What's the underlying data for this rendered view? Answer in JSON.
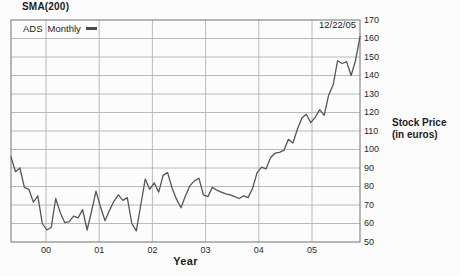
{
  "title": "SMA(200)",
  "legend": {
    "series": "ADS",
    "interval": "Monthly",
    "marker": "line-swatch"
  },
  "date_label": "12/22/05",
  "y_axis": {
    "title_line1": "Stock Price",
    "title_line2": "(in euros)"
  },
  "x_axis": {
    "title": "Year"
  },
  "colors": {
    "series_line": "#565656",
    "grid": "#b2b2b2",
    "plot_border": "#7d7d7d",
    "text": "#1c1c1c",
    "background": "#fcfcfc"
  },
  "chart_data": {
    "type": "line",
    "title": "SMA(200)",
    "series_name": "ADS Monthly",
    "annotation": "12/22/05",
    "xlabel": "Year",
    "ylabel": "Stock Price (in euros)",
    "legend_position": "top-left-inside",
    "grid": true,
    "ylim": [
      50,
      170
    ],
    "ytick_step": 10,
    "x_tick_labels": [
      "00",
      "01",
      "02",
      "03",
      "04",
      "05"
    ],
    "x_tick_years": [
      2000,
      2001,
      2002,
      2003,
      2004,
      2005
    ],
    "x_range_years": [
      1999.34,
      2005.9
    ],
    "values": [
      96,
      88,
      90,
      79.5,
      78.5,
      71.5,
      75,
      60,
      56.5,
      58,
      73.5,
      66,
      60.5,
      61,
      64,
      63,
      67.5,
      56.5,
      66.5,
      77.5,
      69,
      61.5,
      67,
      72,
      75.5,
      72.5,
      74,
      60,
      56,
      70,
      84,
      78.5,
      82,
      77,
      86,
      87.5,
      79,
      73,
      68.5,
      75,
      80.5,
      83,
      84.5,
      75.5,
      74.5,
      79.5,
      78,
      77,
      76,
      75.5,
      74.5,
      73.5,
      75,
      74,
      79,
      87.5,
      90.5,
      89.5,
      95.5,
      98,
      98.5,
      99.5,
      105.5,
      103.5,
      111,
      117,
      119,
      114.5,
      117.5,
      121.5,
      118.5,
      129.5,
      135,
      148,
      146.5,
      147.5,
      140,
      148,
      161
    ]
  }
}
